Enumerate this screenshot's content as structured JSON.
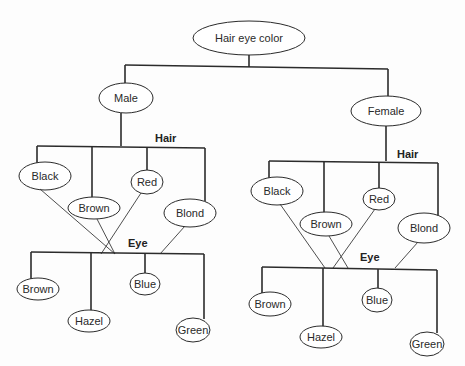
{
  "diagram": {
    "type": "tree",
    "root": {
      "label": "Hair eye color"
    },
    "genders": [
      {
        "label": "Male",
        "hair_label": "Hair",
        "hair": [
          "Black",
          "Brown",
          "Red",
          "Blond"
        ],
        "eye_label": "Eye",
        "eye": [
          "Brown",
          "Hazel",
          "Blue",
          "Green"
        ]
      },
      {
        "label": "Female",
        "hair_label": "Hair",
        "hair": [
          "Black",
          "Brown",
          "Red",
          "Blond"
        ],
        "eye_label": "Eye",
        "eye": [
          "Brown",
          "Hazel",
          "Blue",
          "Green"
        ]
      }
    ]
  },
  "colors": {
    "line": "#2b2b2b",
    "background": "#fdfdfd",
    "text": "#2a2a2a"
  }
}
